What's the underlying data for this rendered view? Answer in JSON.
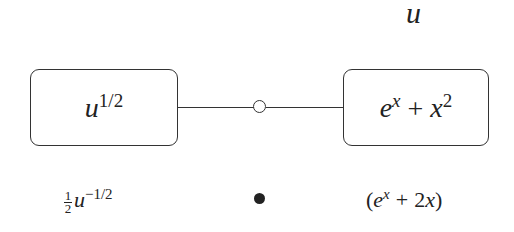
{
  "diagram": {
    "top_label": "u",
    "left_box": {
      "base": "u",
      "exponent": "1/2"
    },
    "right_box": {
      "term1_base": "e",
      "term1_exp": "x",
      "op": "+",
      "term2_base": "x",
      "term2_exp": "2"
    },
    "connector": {
      "node": "open-circle"
    },
    "bottom": {
      "left": {
        "frac_num": "1",
        "frac_den": "2",
        "base": "u",
        "exponent": "−1/2"
      },
      "middle": {
        "node": "filled-dot"
      },
      "right": {
        "open": "(",
        "base": "e",
        "exp": "x",
        "op": "+",
        "coef": "2",
        "var": "x",
        "close": ")"
      }
    }
  }
}
